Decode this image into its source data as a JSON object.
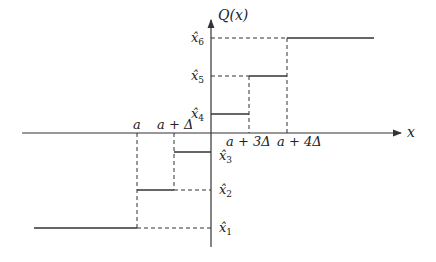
{
  "diagram": {
    "y_axis_label": "Q(x)",
    "x_axis_label": "x",
    "x_tick_labels": [
      {
        "text": "a",
        "x": 137
      },
      {
        "text": "a + Δ",
        "x": 174
      },
      {
        "text": "a + 3Δ",
        "x": 249
      },
      {
        "text": "a + 4Δ",
        "x": 287
      }
    ],
    "y_level_labels": [
      {
        "name": "x̂",
        "sub": "1",
        "y": 228
      },
      {
        "name": "x̂",
        "sub": "2",
        "y": 190
      },
      {
        "name": "x̂",
        "sub": "3",
        "y": 152
      },
      {
        "name": "x̂",
        "sub": "4",
        "y": 114
      },
      {
        "name": "x̂",
        "sub": "5",
        "y": 76
      },
      {
        "name": "x̂",
        "sub": "6",
        "y": 38
      }
    ],
    "steps": [
      {
        "level": "x̂1",
        "x_from": 34,
        "x_to": 137,
        "y": 228
      },
      {
        "level": "x̂2",
        "x_from": 137,
        "x_to": 174,
        "y": 190
      },
      {
        "level": "x̂3",
        "x_from": 174,
        "x_to": 211,
        "y": 152
      },
      {
        "level": "x̂4",
        "x_from": 211,
        "x_to": 249,
        "y": 114
      },
      {
        "level": "x̂5",
        "x_from": 249,
        "x_to": 287,
        "y": 76
      },
      {
        "level": "x̂6",
        "x_from": 287,
        "x_to": 374,
        "y": 38
      }
    ],
    "colors": {
      "line": "#333333",
      "text": "#222222"
    }
  }
}
